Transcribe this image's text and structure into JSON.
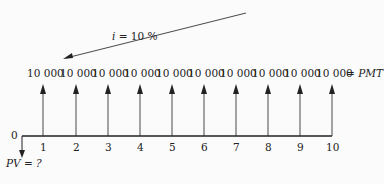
{
  "diagram": {
    "rate_label": "i  =  10 %",
    "payment_label": "= PMT",
    "pv_label": "PV = ?",
    "origin_label": "0",
    "payments": [
      "10 000",
      "10 000",
      "10 000",
      "10 000",
      "10 000",
      "10 000",
      "10 000",
      "10 000",
      "10 000",
      "10 000"
    ],
    "periods": [
      "1",
      "2",
      "3",
      "4",
      "5",
      "6",
      "7",
      "8",
      "9",
      "10"
    ],
    "colors": {
      "line": "#222222",
      "background": "#fbfbfb"
    }
  }
}
